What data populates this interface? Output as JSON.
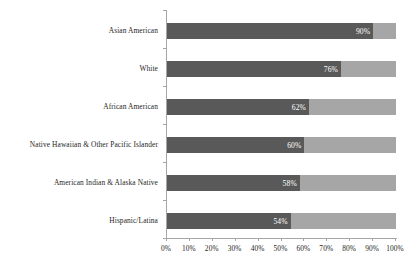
{
  "chart_data": {
    "type": "bar",
    "orientation": "horizontal",
    "stacked": true,
    "title": "",
    "subtitle": "",
    "xlabel": "",
    "ylabel": "",
    "xlim": [
      0,
      100
    ],
    "grid": false,
    "legend": null,
    "categories": [
      "Asian American",
      "White",
      "African American",
      "Native Hawaiian & Other Pacific Islander",
      "American Indian & Alaska Native",
      "Hispanic/Latina"
    ],
    "values": [
      90,
      76,
      62,
      60,
      58,
      54
    ],
    "data_labels": [
      "90%",
      "76%",
      "62%",
      "60%",
      "58%",
      "54%"
    ],
    "xticks": [
      0,
      10,
      20,
      30,
      40,
      50,
      60,
      70,
      80,
      90,
      100
    ],
    "xtick_labels": [
      "0%",
      "10%",
      "20%",
      "30%",
      "40%",
      "50%",
      "60%",
      "70%",
      "80%",
      "90%",
      "100%"
    ],
    "series": [
      {
        "name": "filled",
        "color": "#595959",
        "values": [
          90,
          76,
          62,
          60,
          58,
          54
        ]
      },
      {
        "name": "remainder",
        "color": "#a6a6a6",
        "values": [
          10,
          24,
          38,
          40,
          42,
          46
        ]
      }
    ]
  },
  "colors": {
    "bar_filled": "#595959",
    "bar_remainder": "#a6a6a6",
    "axis": "#a6a6a6",
    "label_text": "#262626",
    "value_text": "#ffffff",
    "background": "#ffffff"
  }
}
